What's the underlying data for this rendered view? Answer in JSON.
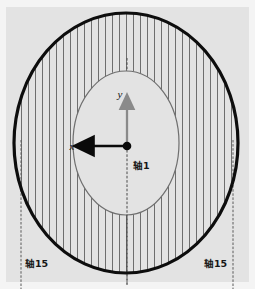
{
  "figure": {
    "title": "",
    "background_color": "#e3e3e3",
    "paper_color": "#f4f4f4"
  },
  "colors": {
    "outer_outline": "#0d0d0d",
    "inner_outline": "#6f6f6f",
    "hatch": "#707070",
    "axis_arrow_x": "#0a0a0a",
    "axis_arrow_y": "#8a8a8a",
    "centerline": "#4a4a4a",
    "fill": "#e3e3e3",
    "text": "#141414"
  },
  "shapes": {
    "outer_ellipse": {
      "cx": 126,
      "cy": 143,
      "rx": 112,
      "ry": 130,
      "stroke_width": 3.2
    },
    "inner_ellipse": {
      "cx": 126,
      "cy": 143,
      "rx": 53,
      "ry": 72,
      "stroke_width": 1.2
    },
    "center_dot": {
      "cx": 127,
      "cy": 146,
      "r": 4.2
    },
    "hatch": {
      "spacing": 7,
      "stroke_width": 1.0,
      "angle_deg": 90
    }
  },
  "axes": {
    "y_arrow": {
      "label": "y",
      "from": [
        127,
        146
      ],
      "to": [
        127,
        101
      ],
      "label_pos": [
        122,
        96
      ]
    },
    "x_arrow": {
      "label": "x",
      "from": [
        127,
        146
      ],
      "to": [
        83,
        146
      ],
      "label_pos": [
        71,
        150
      ]
    },
    "center_axis": {
      "label": "轴1",
      "label_pos": [
        133,
        166
      ]
    },
    "left_axis": {
      "label": "轴15",
      "label_pos": [
        20,
        264
      ],
      "line_x": 21,
      "line_y1": 140,
      "line_y2": 289
    },
    "right_axis": {
      "label": "轴15",
      "label_pos": [
        204,
        264
      ],
      "line_x": 233,
      "line_y1": 140,
      "line_y2": 289
    },
    "center_line": {
      "x": 127,
      "y1": 60,
      "y2": 285
    }
  },
  "labels": {
    "y": "y",
    "x": "x",
    "axis_1": "轴1",
    "axis_15_left": "轴15",
    "axis_15_right": "轴15"
  }
}
